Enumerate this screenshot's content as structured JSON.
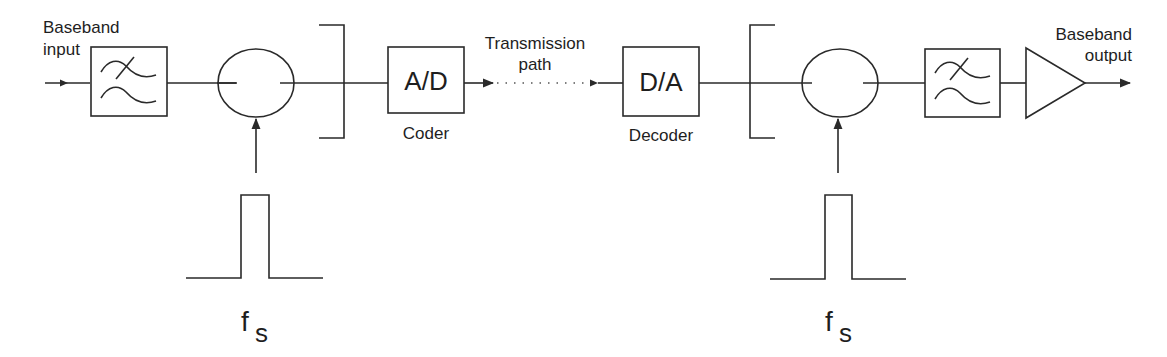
{
  "diagram": {
    "type": "block-diagram",
    "colors": {
      "stroke": "#2a2a2a",
      "text": "#1e1e1e",
      "background": "#ffffff"
    },
    "labels": {
      "baseband_input_line1": "Baseband",
      "baseband_input_line2": "input",
      "baseband_output_line1": "Baseband",
      "baseband_output_line2": "output",
      "transmission_line1": "Transmission",
      "transmission_line2": "path",
      "coder_box": "A/D",
      "coder_caption": "Coder",
      "decoder_box": "D/A",
      "decoder_caption": "Decoder",
      "sampling_left_main": "f",
      "sampling_left_sub": "S",
      "sampling_right_main": "f",
      "sampling_right_sub": "S"
    },
    "blocks": [
      {
        "id": "input-lowpass-filter",
        "kind": "filter",
        "icon": "lowpass-filter-icon"
      },
      {
        "id": "sampling-switch-tx",
        "kind": "switch",
        "icon": "sampling-switch-icon"
      },
      {
        "id": "hold-bracket-tx",
        "kind": "bracket"
      },
      {
        "id": "coder",
        "kind": "box",
        "label": "A/D",
        "caption": "Coder"
      },
      {
        "id": "transmission-path",
        "kind": "dotted-link",
        "label": "Transmission path"
      },
      {
        "id": "decoder",
        "kind": "box",
        "label": "D/A",
        "caption": "Decoder"
      },
      {
        "id": "hold-bracket-rx",
        "kind": "bracket"
      },
      {
        "id": "sampling-switch-rx",
        "kind": "switch",
        "icon": "sampling-switch-icon"
      },
      {
        "id": "output-lowpass-filter",
        "kind": "filter",
        "icon": "lowpass-filter-icon"
      },
      {
        "id": "output-amplifier",
        "kind": "amplifier",
        "icon": "amplifier-triangle-icon"
      }
    ],
    "pulse_generators": [
      {
        "id": "pulse-left",
        "label": "fS",
        "drives": "sampling-switch-tx"
      },
      {
        "id": "pulse-right",
        "label": "fS",
        "drives": "sampling-switch-rx"
      }
    ]
  }
}
